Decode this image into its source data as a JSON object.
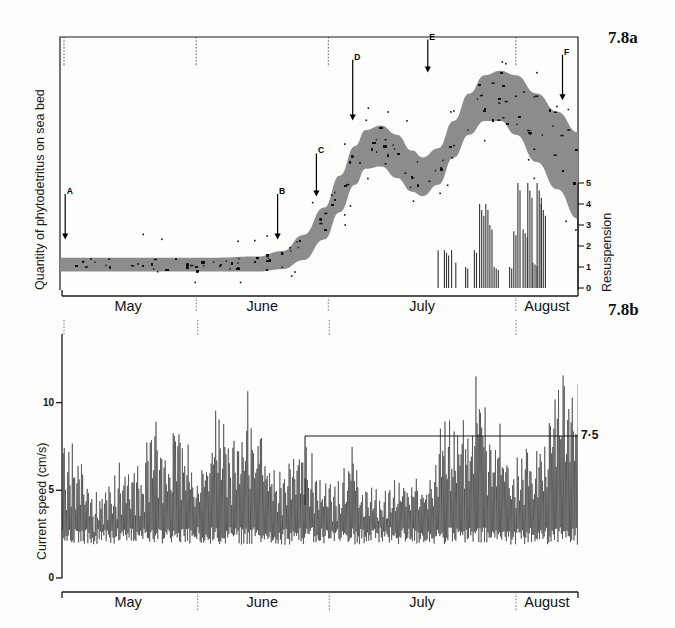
{
  "figure": {
    "panel_a_label": "7.8a",
    "panel_b_label": "7.8b"
  },
  "panel_a": {
    "y_axis_title": "Quantity of phytodetritus on sea bed",
    "right_axis_title": "Resuspension",
    "right_axis_ticks": [
      "0",
      "1",
      "2",
      "3",
      "4",
      "5"
    ],
    "months": [
      "May",
      "June",
      "July",
      "August"
    ],
    "event_markers": [
      {
        "letter": "A"
      },
      {
        "letter": "B"
      },
      {
        "letter": "C"
      },
      {
        "letter": "D"
      },
      {
        "letter": "E"
      },
      {
        "letter": "F"
      }
    ]
  },
  "panel_b": {
    "y_axis_title": "Current speed (cm/s)",
    "y_ticks": [
      "0",
      "5",
      "10"
    ],
    "threshold_label": "7·5",
    "months": [
      "May",
      "June",
      "July",
      "August"
    ]
  },
  "colors": {
    "band_fill": "#8c8c8c",
    "axis": "#1a1a1a",
    "trace": "#2a2a2a",
    "background": "#fdfdfc"
  },
  "chart_data": {
    "type": "line",
    "panels": [
      {
        "id": "7.8a",
        "type": "area",
        "ylabel": "Quantity of phytodetritus on sea bed",
        "ylabel_right": "Resuspension",
        "xlabel": "",
        "xlim": [
          0,
          100
        ],
        "ylim_right": [
          0,
          5
        ],
        "grid": false,
        "categories": [
          "May",
          "June",
          "July",
          "August"
        ],
        "month_boundaries_pct": [
          0,
          26.3,
          51.8,
          88.0,
          100
        ],
        "band_upper": [
          {
            "x": 0,
            "y": 8
          },
          {
            "x": 10,
            "y": 8
          },
          {
            "x": 20,
            "y": 8
          },
          {
            "x": 30,
            "y": 8
          },
          {
            "x": 38,
            "y": 8.5
          },
          {
            "x": 43,
            "y": 11
          },
          {
            "x": 47,
            "y": 18
          },
          {
            "x": 51,
            "y": 30
          },
          {
            "x": 54,
            "y": 44
          },
          {
            "x": 57,
            "y": 57
          },
          {
            "x": 59,
            "y": 64
          },
          {
            "x": 62,
            "y": 66
          },
          {
            "x": 65,
            "y": 62
          },
          {
            "x": 68,
            "y": 55
          },
          {
            "x": 70,
            "y": 52
          },
          {
            "x": 73,
            "y": 56
          },
          {
            "x": 76,
            "y": 68
          },
          {
            "x": 79,
            "y": 80
          },
          {
            "x": 82,
            "y": 88
          },
          {
            "x": 85,
            "y": 90
          },
          {
            "x": 88,
            "y": 88
          },
          {
            "x": 92,
            "y": 80
          },
          {
            "x": 96,
            "y": 72
          },
          {
            "x": 100,
            "y": 63
          }
        ],
        "band_lower": [
          {
            "x": 0,
            "y": 2
          },
          {
            "x": 10,
            "y": 2
          },
          {
            "x": 20,
            "y": 2
          },
          {
            "x": 30,
            "y": 2
          },
          {
            "x": 38,
            "y": 2
          },
          {
            "x": 43,
            "y": 3
          },
          {
            "x": 47,
            "y": 7
          },
          {
            "x": 51,
            "y": 16
          },
          {
            "x": 54,
            "y": 28
          },
          {
            "x": 57,
            "y": 40
          },
          {
            "x": 59,
            "y": 47
          },
          {
            "x": 62,
            "y": 48
          },
          {
            "x": 65,
            "y": 43
          },
          {
            "x": 68,
            "y": 37
          },
          {
            "x": 70,
            "y": 35
          },
          {
            "x": 73,
            "y": 40
          },
          {
            "x": 76,
            "y": 52
          },
          {
            "x": 79,
            "y": 62
          },
          {
            "x": 82,
            "y": 68
          },
          {
            "x": 85,
            "y": 68
          },
          {
            "x": 88,
            "y": 62
          },
          {
            "x": 92,
            "y": 50
          },
          {
            "x": 96,
            "y": 38
          },
          {
            "x": 100,
            "y": 25
          }
        ],
        "event_markers": [
          {
            "letter": "A",
            "x_pct": 1.0,
            "y_top_pct": 62,
            "y_tip_pct": 80
          },
          {
            "letter": "B",
            "x_pct": 42.0,
            "y_top_pct": 62,
            "y_tip_pct": 80
          },
          {
            "letter": "C",
            "x_pct": 49.5,
            "y_top_pct": 46,
            "y_tip_pct": 63
          },
          {
            "letter": "D",
            "x_pct": 56.5,
            "y_top_pct": 9,
            "y_tip_pct": 33
          },
          {
            "letter": "E",
            "x_pct": 71.0,
            "y_top_pct": 1,
            "y_tip_pct": 14
          },
          {
            "letter": "F",
            "x_pct": 97.0,
            "y_top_pct": 7,
            "y_tip_pct": 25
          }
        ],
        "resuspension_spikes": [
          {
            "x_pct": 73.0,
            "value": 1.8
          },
          {
            "x_pct": 74.2,
            "value": 1.8
          },
          {
            "x_pct": 75.6,
            "value": 1.8
          },
          {
            "x_pct": 76.4,
            "value": 1.2
          },
          {
            "x_pct": 78.3,
            "value": 1.0
          },
          {
            "x_pct": 80.0,
            "value": 1.8
          },
          {
            "x_pct": 81.0,
            "value": 4.0
          },
          {
            "x_pct": 82.2,
            "value": 4.0
          },
          {
            "x_pct": 83.0,
            "value": 3.0
          },
          {
            "x_pct": 83.8,
            "value": 1.0
          },
          {
            "x_pct": 86.8,
            "value": 1.0
          },
          {
            "x_pct": 87.6,
            "value": 2.7
          },
          {
            "x_pct": 88.4,
            "value": 5.0
          },
          {
            "x_pct": 89.4,
            "value": 2.8
          },
          {
            "x_pct": 90.3,
            "value": 5.0
          },
          {
            "x_pct": 91.3,
            "value": 1.2
          },
          {
            "x_pct": 92.1,
            "value": 5.0
          },
          {
            "x_pct": 92.9,
            "value": 4.0
          }
        ]
      },
      {
        "id": "7.8b",
        "type": "line",
        "ylabel": "Current speed (cm/s)",
        "xlabel": "",
        "ylim": [
          0,
          13
        ],
        "yticks": [
          0,
          5,
          10
        ],
        "grid": false,
        "categories": [
          "May",
          "June",
          "July",
          "August"
        ],
        "threshold": 7.5,
        "threshold_label": "7·5",
        "threshold_start_pct": 47,
        "envelope_peaks": [
          {
            "x_pct": 1,
            "value": 8.6
          },
          {
            "x_pct": 2,
            "value": 8.9
          },
          {
            "x_pct": 4,
            "value": 7.7
          },
          {
            "x_pct": 6,
            "value": 4.9
          },
          {
            "x_pct": 9,
            "value": 5.8
          },
          {
            "x_pct": 11,
            "value": 6.9
          },
          {
            "x_pct": 13,
            "value": 6.8
          },
          {
            "x_pct": 16,
            "value": 7.2
          },
          {
            "x_pct": 18,
            "value": 9.8
          },
          {
            "x_pct": 20,
            "value": 7.5
          },
          {
            "x_pct": 22,
            "value": 9.4
          },
          {
            "x_pct": 24,
            "value": 8.8
          },
          {
            "x_pct": 26,
            "value": 6.0
          },
          {
            "x_pct": 28,
            "value": 8.4
          },
          {
            "x_pct": 30,
            "value": 10.4
          },
          {
            "x_pct": 32,
            "value": 9.2
          },
          {
            "x_pct": 34,
            "value": 8.0
          },
          {
            "x_pct": 36,
            "value": 11.0
          },
          {
            "x_pct": 38,
            "value": 9.6
          },
          {
            "x_pct": 40,
            "value": 7.6
          },
          {
            "x_pct": 42,
            "value": 6.4
          },
          {
            "x_pct": 45,
            "value": 8.6
          },
          {
            "x_pct": 47,
            "value": 8.2
          },
          {
            "x_pct": 50,
            "value": 6.2
          },
          {
            "x_pct": 53,
            "value": 5.4
          },
          {
            "x_pct": 56,
            "value": 8.2
          },
          {
            "x_pct": 58,
            "value": 6.0
          },
          {
            "x_pct": 61,
            "value": 5.2
          },
          {
            "x_pct": 64,
            "value": 5.6
          },
          {
            "x_pct": 66,
            "value": 6.5
          },
          {
            "x_pct": 68,
            "value": 6.6
          },
          {
            "x_pct": 71,
            "value": 6.3
          },
          {
            "x_pct": 74,
            "value": 9.7
          },
          {
            "x_pct": 76,
            "value": 9.0
          },
          {
            "x_pct": 78,
            "value": 9.6
          },
          {
            "x_pct": 81,
            "value": 12.6
          },
          {
            "x_pct": 83,
            "value": 8.2
          },
          {
            "x_pct": 85,
            "value": 9.4
          },
          {
            "x_pct": 88,
            "value": 7.0
          },
          {
            "x_pct": 91,
            "value": 8.4
          },
          {
            "x_pct": 93,
            "value": 7.6
          },
          {
            "x_pct": 96,
            "value": 11.5
          },
          {
            "x_pct": 98,
            "value": 12.4
          }
        ]
      }
    ]
  }
}
